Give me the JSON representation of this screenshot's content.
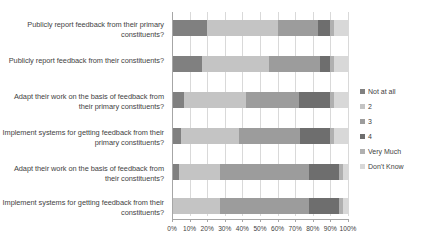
{
  "chart_data": {
    "type": "bar",
    "orientation": "horizontal",
    "stacked": true,
    "stack_mode": "percent",
    "title": "",
    "xlabel": "",
    "ylabel": "",
    "xlim": [
      0,
      100
    ],
    "xticks": [
      "0%",
      "10%",
      "20%",
      "30%",
      "40%",
      "50%",
      "60%",
      "70%",
      "80%",
      "90%",
      "100%"
    ],
    "grid": true,
    "grid_axis": "x",
    "legend_position": "right",
    "categories": [
      "Publicly report feedback from their primary constituents?",
      "Publicly report feedback from their constituents?",
      "Adapt their work on the basis of feedback from their primary constituents?",
      "Implement systems for getting feedback from their primary constituents?",
      "Adapt their work on the basis of feedback from their constituents?",
      "Implement systems for getting feedback from their constituents?"
    ],
    "series": [
      {
        "name": "Not at all",
        "color": "#808080",
        "values": [
          20,
          17,
          7,
          5,
          4,
          0
        ]
      },
      {
        "name": "2",
        "color": "#c4c4c4",
        "values": [
          40,
          38,
          35,
          33,
          23,
          27
        ]
      },
      {
        "name": "3",
        "color": "#9c9c9c",
        "values": [
          23,
          29,
          30,
          35,
          51,
          51
        ]
      },
      {
        "name": "4",
        "color": "#6e6e6e",
        "values": [
          7,
          6,
          18,
          17,
          17,
          17
        ]
      },
      {
        "name": "Very Much",
        "color": "#b0b0b0",
        "values": [
          2,
          2,
          2,
          2,
          2,
          2
        ]
      },
      {
        "name": "Don't Know",
        "color": "#d8d8d8",
        "values": [
          8,
          8,
          8,
          8,
          3,
          3
        ]
      }
    ]
  }
}
